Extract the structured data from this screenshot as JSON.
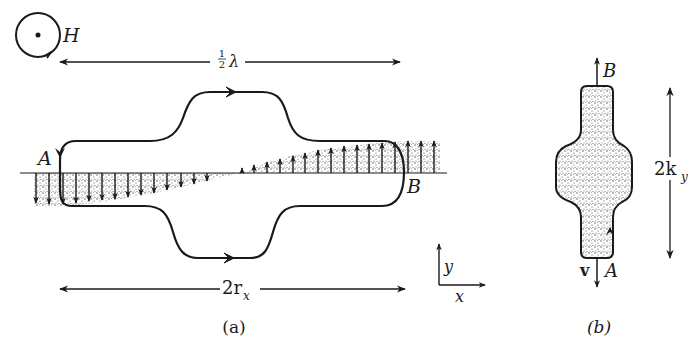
{
  "figure": {
    "panel_a": {
      "caption": "(a)",
      "field_symbol": "H",
      "field_direction": "out-of-page",
      "top_dimension": {
        "label_frac_num": "1",
        "label_frac_den": "2",
        "label_sym": "λ"
      },
      "bottom_dimension": {
        "label_main": "2r",
        "label_sub": "x"
      },
      "point_A": "A",
      "point_B": "B",
      "axes": {
        "x": "x",
        "y": "y"
      }
    },
    "panel_b": {
      "caption": "(b)",
      "point_A": "A",
      "point_B": "B",
      "velocity_label": "v",
      "dimension": {
        "label_main": "2k",
        "label_sub": "y"
      }
    },
    "colors": {
      "ink": "#1a1a1a",
      "stipple": "#555555",
      "background": "#ffffff"
    }
  }
}
